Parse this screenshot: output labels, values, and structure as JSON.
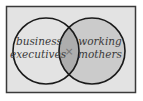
{
  "diagram": {
    "type": "venn",
    "sets": [
      {
        "label_line1": "business",
        "label_line2": "executives"
      },
      {
        "label_line1": "working",
        "label_line2": "mothers"
      }
    ],
    "intersection_mark": "×",
    "colors": {
      "frame_bg": "#e3e3e3",
      "frame_border": "#3a3a3a",
      "right_fill": "#cbcbcb",
      "overlap_fill": "#adadad",
      "stroke": "#1a1a1a",
      "mark": "#777777"
    }
  }
}
